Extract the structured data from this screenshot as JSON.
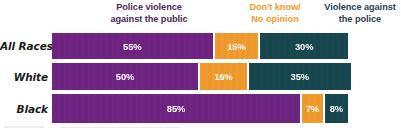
{
  "chart_data": {
    "type": "bar",
    "orientation": "horizontal",
    "stacked": true,
    "title": "",
    "xlabel": "",
    "ylabel": "",
    "xlim": [
      0,
      100
    ],
    "grid": false,
    "legend_position": "top",
    "categories": [
      "All Races",
      "White",
      "Black"
    ],
    "series": [
      {
        "name": "Police violence against the public",
        "color": "#6d2380",
        "values": [
          55,
          50,
          85
        ],
        "value_labels": [
          "55%",
          "50%",
          "85%"
        ]
      },
      {
        "name": "Don't know/ No opinion",
        "color": "#ef9a2e",
        "values": [
          15,
          16,
          7
        ],
        "value_labels": [
          "15%",
          "16%",
          "7%"
        ]
      },
      {
        "name": "Violence against the police",
        "color": "#17464e",
        "values": [
          30,
          35,
          8
        ],
        "value_labels": [
          "30%",
          "35%",
          "8%"
        ]
      }
    ]
  },
  "legend": {
    "items": [
      {
        "line1": "Police violence",
        "line2": "against the public",
        "color": "#4a2a55"
      },
      {
        "line1": "Don't know/",
        "line2": "No opinion",
        "color": "#ef9b2f"
      },
      {
        "line1": "Violence against",
        "line2": "the police",
        "color": "#2b3f52"
      }
    ]
  },
  "rows": [
    {
      "label": "All Races",
      "segments": [
        {
          "label": "55%",
          "value": 55,
          "color": "#6d2380"
        },
        {
          "label": "15%",
          "value": 15,
          "color": "#ef9a2e"
        },
        {
          "label": "30%",
          "value": 30,
          "color": "#17464e"
        }
      ]
    },
    {
      "label": "White",
      "segments": [
        {
          "label": "50%",
          "value": 50,
          "color": "#6d2380"
        },
        {
          "label": "16%",
          "value": 16,
          "color": "#ef9a2e"
        },
        {
          "label": "35%",
          "value": 35,
          "color": "#17464e"
        }
      ]
    },
    {
      "label": "Black",
      "segments": [
        {
          "label": "85%",
          "value": 85,
          "color": "#6d2380"
        },
        {
          "label": "7%",
          "value": 7,
          "color": "#ef9a2e"
        },
        {
          "label": "8%",
          "value": 8,
          "color": "#17464e"
        }
      ]
    }
  ],
  "colors": {
    "background": "#ffffff",
    "purple": "#6d2380",
    "orange": "#ef9a2e",
    "teal": "#17464e",
    "row_label": "#1d1d1d",
    "value_label": "#ffffff"
  }
}
